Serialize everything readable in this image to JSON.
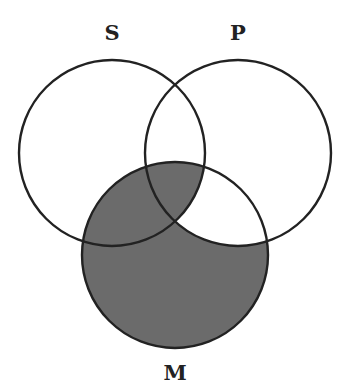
{
  "diagram": {
    "type": "venn",
    "sets": [
      {
        "id": "S",
        "label": "S",
        "cx": 112,
        "cy": 153,
        "r": 93
      },
      {
        "id": "P",
        "label": "P",
        "cx": 238,
        "cy": 153,
        "r": 93
      },
      {
        "id": "M",
        "label": "M",
        "cx": 175,
        "cy": 255,
        "r": 93
      }
    ],
    "shaded_regions": [
      "M only",
      "S∩M (not P)",
      "S∩P∩M"
    ],
    "unshaded_regions_in_M": [
      "P∩M (not S)"
    ],
    "colors": {
      "shade": "#6b6b6b",
      "stroke": "#222222",
      "background": "#ffffff"
    }
  }
}
